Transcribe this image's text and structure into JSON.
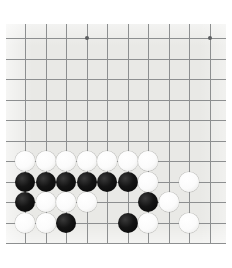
{
  "app": {
    "title": "Go Board Position",
    "board_type": "go-board",
    "board_label": "Go game board corner position"
  },
  "board": {
    "background_color": "#e9e9e6",
    "line_color": "#8d8f90",
    "star_point_color": "#5c5e60",
    "canvas_color": "#ffffff",
    "origin_x": 25,
    "origin_y": 38,
    "spacing": 20.5,
    "columns_visible": 10,
    "rows_visible": 11,
    "stone_radius": 10,
    "star_points": [
      {
        "col": 3,
        "row": 0,
        "name": "star-point-upper-left"
      },
      {
        "col": 9,
        "row": 0,
        "name": "star-point-upper-right"
      }
    ]
  },
  "stones": [
    {
      "col": 0,
      "row": 6,
      "color": "white",
      "label": "white-stone"
    },
    {
      "col": 1,
      "row": 6,
      "color": "white",
      "label": "white-stone"
    },
    {
      "col": 2,
      "row": 6,
      "color": "white",
      "label": "white-stone"
    },
    {
      "col": 3,
      "row": 6,
      "color": "white",
      "label": "white-stone"
    },
    {
      "col": 4,
      "row": 6,
      "color": "white",
      "label": "white-stone"
    },
    {
      "col": 5,
      "row": 6,
      "color": "white",
      "label": "white-stone"
    },
    {
      "col": 6,
      "row": 6,
      "color": "white",
      "label": "white-stone"
    },
    {
      "col": 0,
      "row": 7,
      "color": "black",
      "label": "black-stone"
    },
    {
      "col": 1,
      "row": 7,
      "color": "black",
      "label": "black-stone"
    },
    {
      "col": 2,
      "row": 7,
      "color": "black",
      "label": "black-stone"
    },
    {
      "col": 3,
      "row": 7,
      "color": "black",
      "label": "black-stone"
    },
    {
      "col": 4,
      "row": 7,
      "color": "black",
      "label": "black-stone"
    },
    {
      "col": 5,
      "row": 7,
      "color": "black",
      "label": "black-stone"
    },
    {
      "col": 6,
      "row": 7,
      "color": "white",
      "label": "white-stone"
    },
    {
      "col": 8,
      "row": 7,
      "color": "white",
      "label": "white-stone"
    },
    {
      "col": 0,
      "row": 8,
      "color": "black",
      "label": "black-stone"
    },
    {
      "col": 1,
      "row": 8,
      "color": "white",
      "label": "white-stone"
    },
    {
      "col": 2,
      "row": 8,
      "color": "white",
      "label": "white-stone"
    },
    {
      "col": 3,
      "row": 8,
      "color": "white",
      "label": "white-stone"
    },
    {
      "col": 6,
      "row": 8,
      "color": "black",
      "label": "black-stone"
    },
    {
      "col": 7,
      "row": 8,
      "color": "white",
      "label": "white-stone"
    },
    {
      "col": 0,
      "row": 9,
      "color": "white",
      "label": "white-stone"
    },
    {
      "col": 1,
      "row": 9,
      "color": "white",
      "label": "white-stone"
    },
    {
      "col": 2,
      "row": 9,
      "color": "black",
      "label": "black-stone"
    },
    {
      "col": 5,
      "row": 9,
      "color": "black",
      "label": "black-stone"
    },
    {
      "col": 6,
      "row": 9,
      "color": "white",
      "label": "white-stone"
    },
    {
      "col": 8,
      "row": 9,
      "color": "white",
      "label": "white-stone"
    }
  ]
}
